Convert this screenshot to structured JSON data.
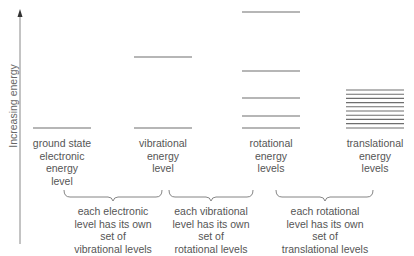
{
  "axis": {
    "label": "Increasing energy",
    "line_color": "#777777"
  },
  "columns": [
    {
      "id": "electronic",
      "label": "ground state\nelectronic\nenergy\nlevel",
      "levels_y": [
        128
      ]
    },
    {
      "id": "vibrational",
      "label": "vibrational\nenergy\nlevel",
      "levels_y": [
        57,
        128
      ]
    },
    {
      "id": "rotational",
      "label": "rotational\nenergy\nlevels",
      "levels_y": [
        12,
        71,
        98,
        116,
        128
      ]
    },
    {
      "id": "translational",
      "label": "translational\nenergy\nlevels",
      "levels_y": [
        90,
        94.2,
        98.4,
        102.6,
        106.8,
        111,
        115.2,
        119.4,
        123.6,
        128
      ]
    }
  ],
  "brackets": [
    {
      "id": "electronic-to-vibrational",
      "text": "each electronic\nlevel has its own\nset of\nvibrational levels"
    },
    {
      "id": "vibrational-to-rotational",
      "text": "each vibrational\nlevel has its own\nset of\nrotational levels"
    },
    {
      "id": "rotational-to-translational",
      "text": "each rotational\nlevel has its own\nset of\ntranslational levels"
    }
  ],
  "colors": {
    "level_line": "#6e6e6e",
    "text": "#555555",
    "bracket": "#777777"
  }
}
